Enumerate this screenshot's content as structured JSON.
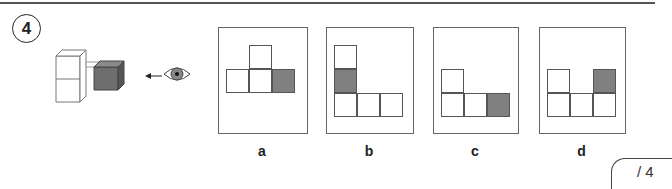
{
  "question": {
    "number": "4"
  },
  "stimulus": {
    "icon": "eye-icon",
    "arrow": "arrow-left-icon",
    "description": "3D cube arrangement viewed from right side"
  },
  "options": [
    {
      "label": "a",
      "cells": [
        [
          1,
          0,
          "w"
        ],
        [
          0,
          1,
          "w"
        ],
        [
          1,
          1,
          "w"
        ],
        [
          2,
          1,
          "g"
        ]
      ]
    },
    {
      "label": "b",
      "cells": [
        [
          0,
          0,
          "w"
        ],
        [
          0,
          1,
          "g"
        ],
        [
          0,
          2,
          "w"
        ],
        [
          1,
          2,
          "w"
        ],
        [
          2,
          2,
          "w"
        ]
      ]
    },
    {
      "label": "c",
      "cells": [
        [
          0,
          1,
          "w"
        ],
        [
          0,
          2,
          "w"
        ],
        [
          1,
          2,
          "w"
        ],
        [
          2,
          2,
          "g"
        ]
      ]
    },
    {
      "label": "d",
      "cells": [
        [
          0,
          1,
          "w"
        ],
        [
          2,
          1,
          "g"
        ],
        [
          0,
          2,
          "w"
        ],
        [
          1,
          2,
          "w"
        ],
        [
          2,
          2,
          "w"
        ]
      ]
    }
  ],
  "score": {
    "text": "/ 4"
  },
  "colors": {
    "gray": "#808080",
    "line": "#555555"
  }
}
